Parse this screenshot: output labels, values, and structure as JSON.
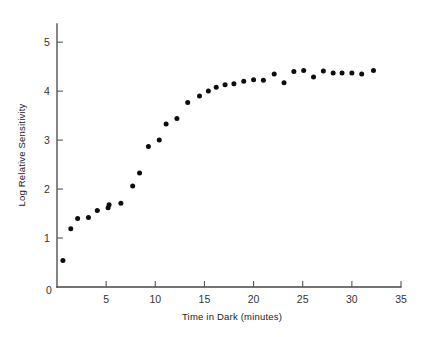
{
  "chart_data": {
    "type": "scatter",
    "title": "",
    "subtitle": "",
    "xlabel": "Time in Dark (minutes)",
    "ylabel": "Log Relative Sensitivity",
    "xlim": [
      0,
      35
    ],
    "ylim": [
      0,
      5.35
    ],
    "xticks": [
      0,
      5,
      10,
      15,
      20,
      25,
      30,
      35
    ],
    "xtick_labels": [
      "0",
      "5",
      "10",
      "15",
      "20",
      "25",
      "30",
      "35"
    ],
    "yticks": [
      0,
      1,
      2,
      3,
      4,
      5
    ],
    "ytick_labels": [
      "0",
      "1",
      "2",
      "3",
      "4",
      "5"
    ],
    "grid": false,
    "legend": null,
    "marker": "filled-circle",
    "marker_color": "#0d0d0d",
    "marker_size_px": 5,
    "series": [
      {
        "name": "Log Relative Sensitivity",
        "x": [
          0.6,
          1.4,
          2.1,
          3.2,
          4.1,
          5.2,
          5.3,
          6.5,
          7.7,
          8.4,
          9.3,
          10.4,
          11.1,
          12.2,
          13.3,
          14.5,
          15.4,
          16.2,
          17.1,
          18.0,
          19.0,
          20.0,
          21.0,
          22.1,
          23.1,
          24.1,
          25.1,
          26.1,
          27.1,
          28.1,
          29.0,
          30.0,
          31.0,
          32.2
        ],
        "y": [
          0.54,
          1.19,
          1.4,
          1.42,
          1.56,
          1.62,
          1.68,
          1.71,
          2.06,
          2.33,
          2.87,
          3.0,
          3.33,
          3.44,
          3.77,
          3.9,
          4.0,
          4.08,
          4.13,
          4.15,
          4.2,
          4.23,
          4.22,
          4.35,
          4.17,
          4.4,
          4.42,
          4.29,
          4.41,
          4.37,
          4.37,
          4.37,
          4.35,
          4.42
        ]
      }
    ]
  },
  "axes": {
    "x_title": "Time in Dark (minutes)",
    "y_title": "Log Relative Sensitivity"
  }
}
